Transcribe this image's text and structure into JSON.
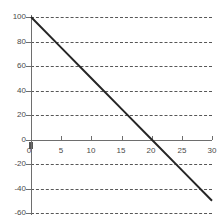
{
  "chart_data": {
    "type": "line",
    "title": "",
    "subtitle": "",
    "xlabel": "",
    "ylabel": "",
    "xlim": [
      0,
      30
    ],
    "ylim": [
      -60,
      100
    ],
    "grid": "horizontal-dashed",
    "legend": "none",
    "xticks": [
      0,
      5,
      10,
      15,
      20,
      25,
      30
    ],
    "xtick_labels": [
      "0",
      "5",
      "10",
      "15",
      "20",
      "25",
      "30"
    ],
    "yticks": [
      -60,
      -40,
      -20,
      0,
      20,
      40,
      60,
      80,
      100
    ],
    "ytick_labels": [
      "-60",
      "-40",
      "-20",
      "0",
      "20",
      "40",
      "60",
      "80",
      "100"
    ],
    "series": [
      {
        "name": "line",
        "color": "#262626",
        "x": [
          0,
          5,
          10,
          15,
          20,
          25,
          30
        ],
        "values": [
          100,
          75,
          50,
          25,
          0,
          -25,
          -50
        ]
      }
    ],
    "annotations": [],
    "x_intercept": 20,
    "y_intercept": 100,
    "slope": -5
  },
  "style": {
    "axis_color": "#6e6e6e",
    "grid_color": "#3a3a3a",
    "label_color": "#4a4a4a",
    "line_color": "#262626",
    "background": "#ffffff"
  }
}
